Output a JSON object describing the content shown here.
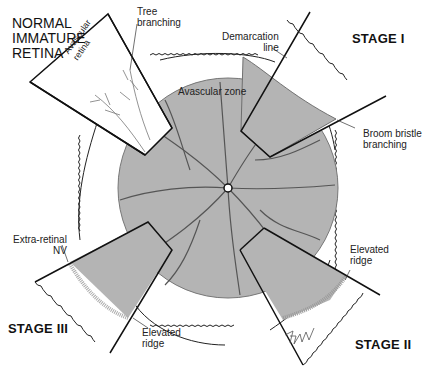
{
  "diagram": {
    "title": "NORMAL\nIMMATURE\nRETINA",
    "center_label": "Avascular zone",
    "stages": [
      {
        "name": "STAGE I",
        "labels": [
          "Demarcation\nline",
          "Broom bristle\nbranching"
        ]
      },
      {
        "name": "STAGE II",
        "labels": [
          "Elevated\nridge"
        ]
      },
      {
        "name": "STAGE III",
        "labels": [
          "Extra-retinal\nNV",
          "Elevated\nridge"
        ]
      }
    ],
    "normal_labels": [
      "Tree\nbranching",
      "Avascular\nretina"
    ],
    "signature": "T. Hengst",
    "colors": {
      "vascular": "#b4b4b4",
      "vessel": "#555555",
      "outline": "#111111",
      "background": "#ffffff"
    }
  }
}
